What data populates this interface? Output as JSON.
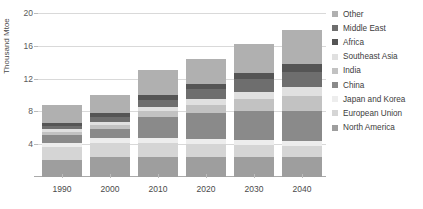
{
  "chart_data": {
    "type": "bar",
    "subtype": "stacked-bar",
    "title": "",
    "xlabel": "",
    "ylabel": "Thousand Mtoe",
    "categories": [
      "1990",
      "2000",
      "2010",
      "2020",
      "2030",
      "2040"
    ],
    "ylim": [
      0,
      20
    ],
    "yticks": [
      4,
      8,
      12,
      16,
      20
    ],
    "grid": true,
    "legend_position": "right",
    "series": [
      {
        "name": "North America",
        "color": "#9e9e9e",
        "values": [
          2.1,
          2.4,
          2.4,
          2.4,
          2.4,
          2.4
        ]
      },
      {
        "name": "European Union",
        "color": "#d5d5d5",
        "values": [
          1.6,
          1.7,
          1.7,
          1.6,
          1.5,
          1.4
        ]
      },
      {
        "name": "Japan and Korea",
        "color": "#ededed",
        "values": [
          0.5,
          0.6,
          0.6,
          0.6,
          0.6,
          0.6
        ]
      },
      {
        "name": "China",
        "color": "#8a8a8a",
        "values": [
          0.9,
          1.1,
          2.6,
          3.2,
          3.6,
          3.7
        ]
      },
      {
        "name": "India",
        "color": "#c2c2c2",
        "values": [
          0.4,
          0.5,
          0.7,
          1.0,
          1.4,
          1.8
        ]
      },
      {
        "name": "Southeast Asia",
        "color": "#e0e0e0",
        "values": [
          0.3,
          0.4,
          0.5,
          0.7,
          0.9,
          1.1
        ]
      },
      {
        "name": "Middle East",
        "color": "#6e6e6e",
        "values": [
          0.4,
          0.6,
          0.9,
          1.2,
          1.5,
          1.8
        ]
      },
      {
        "name": "Africa",
        "color": "#555555",
        "values": [
          0.4,
          0.5,
          0.6,
          0.7,
          0.8,
          1.0
        ]
      },
      {
        "name": "Other",
        "color": "#b0b0b0",
        "values": [
          2.2,
          2.2,
          3.0,
          3.0,
          3.5,
          4.1
        ]
      }
    ],
    "totals": [
      8.8,
      10.0,
      13.0,
      14.4,
      16.2,
      17.9
    ]
  },
  "legend": {
    "entries": [
      {
        "label": "Other",
        "color": "#b0b0b0"
      },
      {
        "label": "Middle East",
        "color": "#6e6e6e"
      },
      {
        "label": "Africa",
        "color": "#555555"
      },
      {
        "label": "Southeast Asia",
        "color": "#e0e0e0"
      },
      {
        "label": "India",
        "color": "#c2c2c2"
      },
      {
        "label": "China",
        "color": "#8a8a8a"
      },
      {
        "label": "Japan and Korea",
        "color": "#ededed"
      },
      {
        "label": "European Union",
        "color": "#d5d5d5"
      },
      {
        "label": "North America",
        "color": "#9e9e9e"
      }
    ]
  }
}
